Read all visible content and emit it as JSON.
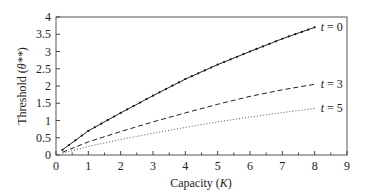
{
  "chart_data": {
    "type": "line",
    "title": "",
    "xlabel": "Capacity (K)",
    "ylabel": "Threshold (θ**)",
    "xlim": [
      0,
      9
    ],
    "ylim": [
      0,
      4
    ],
    "xticks": [
      0,
      1,
      2,
      3,
      4,
      5,
      6,
      7,
      8,
      9
    ],
    "yticks": [
      0,
      0.5,
      1,
      1.5,
      2,
      2.5,
      3,
      3.5,
      4
    ],
    "ytick_labels": [
      "0",
      "0.5",
      "1",
      "1.5",
      "2",
      "2.5",
      "3",
      "3.5",
      "4"
    ],
    "grid": false,
    "legend": "inline labels at right end of each curve",
    "x": [
      0.2,
      1,
      2,
      3,
      4,
      5,
      6,
      7,
      8
    ],
    "series": [
      {
        "name": "t = 0",
        "style": "solid-with-markers",
        "values": [
          0.15,
          0.7,
          1.22,
          1.72,
          2.2,
          2.62,
          3.0,
          3.37,
          3.7
        ]
      },
      {
        "name": "t = 3",
        "style": "dashed",
        "values": [
          0.08,
          0.38,
          0.68,
          0.96,
          1.22,
          1.47,
          1.7,
          1.89,
          2.05
        ]
      },
      {
        "name": "t = 5",
        "style": "dotted",
        "values": [
          0.05,
          0.25,
          0.45,
          0.63,
          0.8,
          0.96,
          1.1,
          1.23,
          1.35
        ]
      }
    ]
  },
  "labels": {
    "xlabel_main": "Capacity (",
    "xlabel_var": "K",
    "xlabel_end": ")",
    "ylabel_main": "Threshold (",
    "ylabel_var": "θ**",
    "ylabel_end": ")"
  }
}
